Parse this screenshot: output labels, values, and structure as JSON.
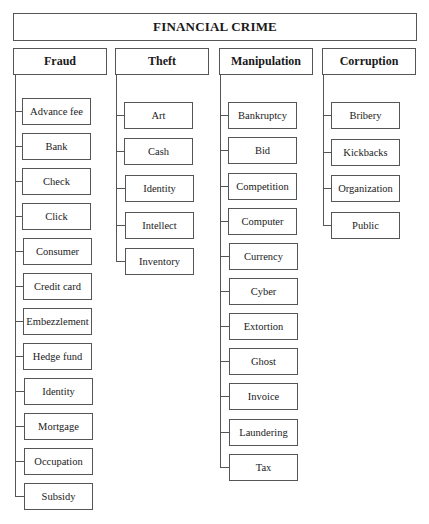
{
  "diagram": {
    "title": "FINANCIAL CRIME",
    "type": "hierarchy-tree",
    "categories": [
      {
        "label": "Fraud",
        "items": [
          "Advance fee",
          "Bank",
          "Check",
          "Click",
          "Consumer",
          "Credit card",
          "Embezzlement",
          "Hedge fund",
          "Identity",
          "Mortgage",
          "Occupation",
          "Subsidy"
        ]
      },
      {
        "label": "Theft",
        "items": [
          "Art",
          "Cash",
          "Identity",
          "Intellect",
          "Inventory"
        ]
      },
      {
        "label": "Manipulation",
        "items": [
          "Bankruptcy",
          "Bid",
          "Competition",
          "Computer",
          "Currency",
          "Cyber",
          "Extortion",
          "Ghost",
          "Invoice",
          "Laundering",
          "Tax"
        ]
      },
      {
        "label": "Corruption",
        "items": [
          "Bribery",
          "Kickbacks",
          "Organization",
          "Public"
        ]
      }
    ]
  },
  "colors": {
    "line": "#555555",
    "text": "#1a1a1a",
    "background": "#ffffff"
  }
}
